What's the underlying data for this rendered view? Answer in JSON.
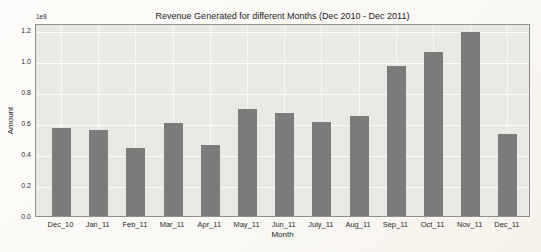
{
  "chart_data": {
    "type": "bar",
    "title": "Revenue Generated for different Months (Dec 2010 - Dec 2011)",
    "xlabel": "Month",
    "ylabel": "Amount",
    "y_offset_label": "1e8",
    "categories": [
      "Dec_10",
      "Jan_11",
      "Feb_11",
      "Mar_11",
      "Apr_11",
      "May_11",
      "Jun_11",
      "July_11",
      "Aug_11",
      "Sep_11",
      "Oct_11",
      "Nov_11",
      "Dec_11"
    ],
    "values": [
      0.57,
      0.56,
      0.44,
      0.6,
      0.46,
      0.69,
      0.67,
      0.61,
      0.65,
      0.97,
      1.06,
      1.19,
      0.53
    ],
    "values_scale": "1e8",
    "y_ticks": [
      "0.0",
      "0.2",
      "0.4",
      "0.6",
      "0.8",
      "1.0",
      "1.2"
    ],
    "ylim": [
      0,
      1.25
    ],
    "grid": true,
    "legend": "none",
    "bar_color": "#7b7b7b",
    "plot_bg": "#e9e8e3"
  }
}
